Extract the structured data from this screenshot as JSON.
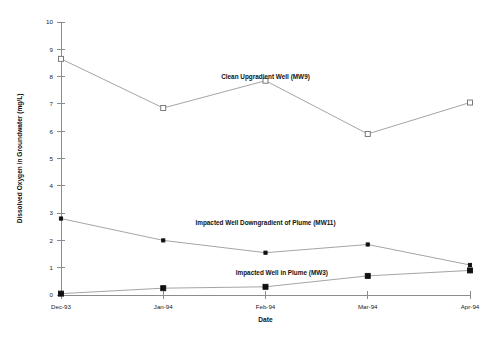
{
  "chart_data": {
    "type": "line",
    "title": "",
    "xlabel": "Date",
    "ylabel": "Dissolved Oxygen in Groundwater (mg/L)",
    "categories": [
      "Dec-93",
      "Jan-94",
      "Feb-94",
      "Mar-94",
      "Apr-94"
    ],
    "ylim": [
      0,
      10
    ],
    "ytick_labels": [
      "0",
      "1",
      "2",
      "3",
      "4",
      "5",
      "6",
      "7",
      "8",
      "9",
      "10"
    ],
    "ytick_values": [
      0,
      1,
      2,
      3,
      4,
      5,
      6,
      7,
      8,
      9,
      10
    ],
    "grid": false,
    "legend_position": "inline-annotations",
    "series": [
      {
        "name": "Clean Upgradient Well (MW9)",
        "marker": "open-square",
        "values": [
          8.65,
          6.85,
          7.85,
          5.9,
          7.05
        ],
        "annotation": "Clean Upgradient Well (MW9)"
      },
      {
        "name": "Impacted Well Downgradient of Plume (MW11)",
        "marker": "filled-small-square",
        "values": [
          2.8,
          2.0,
          1.55,
          1.85,
          1.1
        ],
        "annotation": "Impacted Well Downgradient of Plume (MW11)"
      },
      {
        "name": "Impacted Well in Plume (MW3)",
        "marker": "filled-square",
        "values": [
          0.05,
          0.25,
          0.3,
          0.7,
          0.9
        ],
        "annotation": "Impacted Well in Plume (MW3)"
      }
    ],
    "annotations": [
      {
        "text": "Clean Upgradient Well (MW9)",
        "x_frac": 0.5,
        "y_value": 7.9
      },
      {
        "text": "Impacted Well Downgradient of Plume (MW11)",
        "x_frac": 0.5,
        "y_value": 2.55
      },
      {
        "text": "Impacted Well in Plume (MW3)",
        "x_frac": 0.54,
        "y_value": 0.75
      }
    ],
    "colors": {
      "axis": "#8c8c8c",
      "line": "#9a9a9a",
      "marker_fill": "#111111",
      "marker_open_fill": "#ffffff",
      "text": "#111111",
      "background": "#ffffff"
    }
  }
}
